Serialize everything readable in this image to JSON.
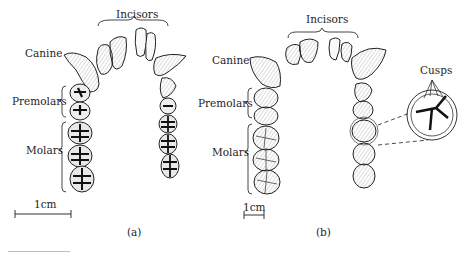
{
  "figure": {
    "panel_a": {
      "caption": "(a)",
      "labels": {
        "incisors": "Incisors",
        "canine": "Canine",
        "premolars": "Premolars",
        "molars": "Molars"
      },
      "scale_bar": "1cm"
    },
    "panel_b": {
      "caption": "(b)",
      "labels": {
        "incisors": "Incisors",
        "canine": "Canine",
        "premolars": "Premolars",
        "molars": "Molars",
        "cusps": "Cusps"
      },
      "scale_bar": "1cm"
    }
  }
}
